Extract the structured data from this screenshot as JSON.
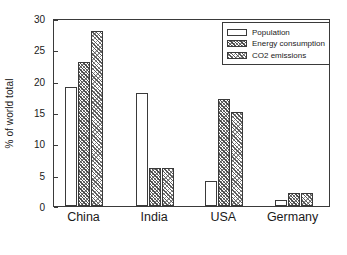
{
  "chart_data": {
    "type": "bar",
    "title": "",
    "xlabel": "",
    "ylabel": "% of world total",
    "ylim": [
      0,
      30
    ],
    "yticks": [
      0,
      5,
      10,
      15,
      20,
      25,
      30
    ],
    "grid": false,
    "legend_position": "top-right",
    "categories": [
      "China",
      "India",
      "USA",
      "Germany"
    ],
    "series": [
      {
        "name": "Population",
        "pattern": "plain",
        "values": [
          19,
          18,
          4,
          1
        ]
      },
      {
        "name": "Energy consumption",
        "pattern": "hatch-dense",
        "values": [
          23,
          6,
          17,
          2
        ]
      },
      {
        "name": "CO2 emissions",
        "pattern": "hatch-diag",
        "values": [
          28,
          6,
          15,
          2
        ]
      }
    ]
  },
  "axes": {
    "y_label": "% of world total",
    "y_ticks": [
      "0",
      "5",
      "10",
      "15",
      "20",
      "25",
      "30"
    ],
    "x_ticks": [
      "China",
      "India",
      "USA",
      "Germany"
    ]
  },
  "legend": {
    "entries": [
      {
        "label": "Population"
      },
      {
        "label": "Energy consumption"
      },
      {
        "label": "CO2 emissions"
      }
    ]
  },
  "colors": {
    "axis": "#3a3a3a",
    "background": "#ffffff",
    "bar_edge": "#3a3a3a",
    "hatch": "#4a4a4a"
  }
}
